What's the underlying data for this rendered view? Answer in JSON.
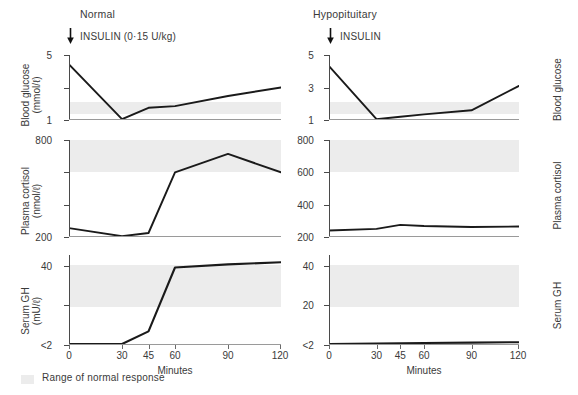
{
  "figure": {
    "legend_label": "Range of normal response",
    "xlabel": "Minutes",
    "x_ticks": [
      "0",
      "30",
      "45",
      "60",
      "90",
      "120"
    ],
    "insulin_arrow_icon": "down-arrow-icon",
    "band_color": "#ececec",
    "curve_color": "#1a1a1a",
    "axis_color": "#4a4a4a"
  },
  "columns": [
    {
      "title": "Normal",
      "insulin_note": "INSULIN (0·15 U/kg)"
    },
    {
      "title": "Hypopituitary",
      "insulin_note": "INSULIN"
    }
  ],
  "row_labels": [
    {
      "line1": "Blood glucose",
      "line2": "(mmol/ℓ)",
      "short": "Blood glucose"
    },
    {
      "line1": "Plasma cortisol",
      "line2": "(nmol/ℓ)",
      "short": "Plasma cortisol"
    },
    {
      "line1": "Serum GH",
      "line2": "(mU/ℓ)",
      "short": "Serum GH"
    }
  ],
  "axes": {
    "glucose": {
      "ticks": [
        1,
        3,
        5
      ],
      "tick_labels": [
        "1",
        "3",
        "5"
      ],
      "ylim": [
        1,
        5
      ],
      "normal_band": [
        1.4,
        2.1
      ]
    },
    "cortisol": {
      "ticks": [
        200,
        400,
        600,
        800
      ],
      "tick_labels": [
        "200",
        "400",
        "600",
        "800"
      ],
      "ylim": [
        200,
        800
      ],
      "normal_band": [
        600,
        800
      ]
    },
    "gh": {
      "ticks": [
        2,
        20,
        40
      ],
      "tick_labels": [
        "<2",
        "20",
        "40"
      ],
      "ylim": [
        2,
        45
      ],
      "normal_band": [
        20,
        40
      ]
    }
  },
  "chart_data": {
    "type": "line",
    "xlabel": "Minutes",
    "x": [
      0,
      30,
      45,
      60,
      90,
      120
    ],
    "legend": [
      "Range of normal response"
    ],
    "grid": false,
    "panels": [
      {
        "column": "Normal",
        "row": "Blood glucose",
        "ylabel": "Blood glucose (mmol/ℓ)",
        "ylim": [
          1,
          5
        ],
        "yticks": [
          1,
          3,
          5
        ],
        "ytick_labels": [
          "1",
          "3",
          "5"
        ],
        "normal_band": [
          1.4,
          2.1
        ],
        "series": [
          {
            "name": "Blood glucose",
            "values": [
              4.5,
              1.05,
              1.7,
              1.8,
              2.4,
              2.9
            ]
          }
        ]
      },
      {
        "column": "Normal",
        "row": "Plasma cortisol",
        "ylabel": "Plasma cortisol (nmol/ℓ)",
        "ylim": [
          200,
          800
        ],
        "yticks": [
          200,
          400,
          600,
          800
        ],
        "ytick_labels": [
          "200",
          "400",
          "600",
          "800"
        ],
        "normal_band": [
          600,
          800
        ],
        "series": [
          {
            "name": "Plasma cortisol",
            "values": [
              255,
              205,
              225,
              600,
              720,
              600
            ]
          }
        ]
      },
      {
        "column": "Normal",
        "row": "Serum GH",
        "ylabel": "Serum GH (mU/ℓ)",
        "ylim": [
          2,
          45
        ],
        "yticks": [
          2,
          20,
          40
        ],
        "ytick_labels": [
          "<2",
          "20",
          "40"
        ],
        "normal_band": [
          20,
          40
        ],
        "series": [
          {
            "name": "Serum GH",
            "values": [
              2,
              2,
              8,
              39,
              40.5,
              41.5
            ]
          }
        ]
      },
      {
        "column": "Hypopituitary",
        "row": "Blood glucose",
        "ylabel": "Blood glucose (mmol/ℓ)",
        "ylim": [
          1,
          5
        ],
        "yticks": [
          1,
          3,
          5
        ],
        "ytick_labels": [
          "1",
          "3",
          "5"
        ],
        "normal_band": [
          1.4,
          2.1
        ],
        "series": [
          {
            "name": "Blood glucose",
            "values": [
              4.4,
              1.05,
              1.2,
              1.35,
              1.6,
              3.1
            ]
          }
        ]
      },
      {
        "column": "Hypopituitary",
        "row": "Plasma cortisol",
        "ylabel": "Plasma cortisol (nmol/ℓ)",
        "ylim": [
          200,
          800
        ],
        "yticks": [
          200,
          400,
          600,
          800
        ],
        "ytick_labels": [
          "200",
          "400",
          "600",
          "800"
        ],
        "normal_band": [
          600,
          800
        ],
        "series": [
          {
            "name": "Plasma cortisol",
            "values": [
              240,
              250,
              275,
              268,
              262,
              265
            ]
          }
        ]
      },
      {
        "column": "Hypopituitary",
        "row": "Serum GH",
        "ylabel": "Serum GH (mU/ℓ)",
        "ylim": [
          2,
          45
        ],
        "yticks": [
          2,
          20,
          40
        ],
        "ytick_labels": [
          "<2",
          "20",
          "40"
        ],
        "normal_band": [
          20,
          40
        ],
        "series": [
          {
            "name": "Serum GH",
            "values": [
              2,
              2,
              2.2,
              2.3,
              2.4,
              2.6
            ]
          }
        ]
      }
    ]
  }
}
